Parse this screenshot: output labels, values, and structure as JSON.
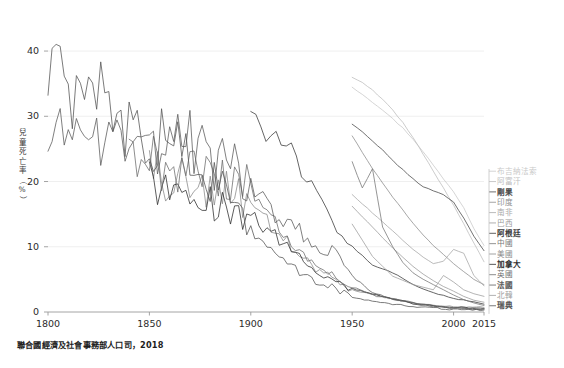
{
  "chart_data": {
    "type": "line",
    "title": "",
    "xlabel": "",
    "ylabel": "兒童死亡率（%）",
    "source_note": "聯合國經濟及社會事務部人口司，2018",
    "xlim": [
      1800,
      2015
    ],
    "ylim": [
      0,
      42
    ],
    "xticks": [
      1800,
      1850,
      1900,
      1950,
      2000,
      2015
    ],
    "yticks": [
      0,
      10,
      20,
      30,
      40
    ],
    "grid": true,
    "legend_position": "right",
    "series": [
      {
        "name": "布吉納法索",
        "color": "#c9c9c9",
        "legend_index": 0,
        "x": [
          1950,
          1955,
          1960,
          1965,
          1970,
          1975,
          1980,
          1985,
          1990,
          1995,
          2000,
          2005,
          2010,
          2015
        ],
        "values": [
          34.5,
          33.4,
          32.2,
          31.0,
          29.6,
          28.2,
          26.5,
          24.6,
          22.5,
          20.4,
          18.4,
          16.0,
          12.8,
          10.2
        ]
      },
      {
        "name": "阿富汗",
        "color": "#bdbdbd",
        "legend_index": 1,
        "x": [
          1950,
          1955,
          1960,
          1965,
          1970,
          1975,
          1980,
          1985,
          1990,
          1995,
          2000,
          2005,
          2010,
          2015
        ],
        "values": [
          36.0,
          35.2,
          34.0,
          32.6,
          31.0,
          29.0,
          26.8,
          24.2,
          21.6,
          19.0,
          16.4,
          13.5,
          10.6,
          7.7
        ]
      },
      {
        "name": "剛果",
        "color": "#4a4a4a",
        "legend_index": 2,
        "x": [
          1950,
          1955,
          1960,
          1965,
          1970,
          1975,
          1980,
          1985,
          1990,
          1995,
          2000,
          2005,
          2010,
          2015
        ],
        "values": [
          28.8,
          27.6,
          26.2,
          24.8,
          23.2,
          21.8,
          20.4,
          19.2,
          18.6,
          18.0,
          16.8,
          14.4,
          11.6,
          9.4
        ]
      },
      {
        "name": "印度",
        "color": "#8e8e8e",
        "legend_index": 3,
        "x": [
          1950,
          1955,
          1960,
          1965,
          1970,
          1975,
          1980,
          1985,
          1990,
          1995,
          2000,
          2005,
          2010,
          2015
        ],
        "values": [
          27.0,
          24.4,
          22.0,
          19.8,
          17.6,
          15.6,
          13.6,
          11.8,
          10.2,
          8.8,
          7.4,
          6.2,
          5.0,
          4.2
        ]
      },
      {
        "name": "南非",
        "color": "#a8a8a8",
        "legend_index": 4,
        "x": [
          1950,
          1955,
          1960,
          1965,
          1970,
          1975,
          1980,
          1985,
          1990,
          1995,
          2000,
          2005,
          2010,
          2015
        ],
        "values": [
          18.0,
          16.6,
          15.2,
          13.8,
          12.4,
          11.0,
          9.6,
          8.4,
          7.4,
          7.8,
          9.6,
          9.0,
          5.6,
          4.0
        ]
      },
      {
        "name": "巴西",
        "color": "#9a9a9a",
        "legend_index": 5,
        "x": [
          1950,
          1955,
          1960,
          1965,
          1970,
          1975,
          1980,
          1985,
          1990,
          1995,
          2000,
          2005,
          2010,
          2015
        ],
        "values": [
          16.2,
          14.6,
          13.0,
          11.4,
          9.8,
          8.4,
          7.0,
          5.8,
          4.8,
          3.9,
          3.2,
          2.4,
          1.8,
          1.5
        ]
      },
      {
        "name": "阿根廷",
        "color": "#3a3a3a",
        "legend_index": 6,
        "x": [
          1900,
          1910,
          1920,
          1930,
          1940,
          1950,
          1960,
          1970,
          1980,
          1990,
          2000,
          2010,
          2015
        ],
        "values": [
          30.0,
          27.0,
          24.5,
          19.0,
          14.0,
          10.0,
          7.2,
          6.0,
          4.2,
          2.9,
          2.1,
          1.5,
          1.2
        ]
      },
      {
        "name": "中國",
        "color": "#787878",
        "legend_index": 7,
        "x": [
          1950,
          1955,
          1960,
          1965,
          1970,
          1975,
          1980,
          1985,
          1990,
          1995,
          2000,
          2005,
          2010,
          2015
        ],
        "values": [
          23.0,
          19.0,
          22.0,
          13.0,
          10.0,
          7.6,
          6.0,
          5.0,
          4.2,
          3.4,
          2.6,
          1.9,
          1.4,
          1.0
        ]
      },
      {
        "name": "美國",
        "color": "#8a8a8a",
        "legend_index": 8,
        "x": [
          1850,
          1870,
          1890,
          1900,
          1910,
          1920,
          1930,
          1940,
          1950,
          1960,
          1970,
          1980,
          1990,
          2000,
          2015
        ],
        "values": [
          22.0,
          19.5,
          18.0,
          16.0,
          13.0,
          10.0,
          7.0,
          5.2,
          3.4,
          2.7,
          2.0,
          1.4,
          1.0,
          0.8,
          0.7
        ]
      },
      {
        "name": "加拿大",
        "color": "#2e2e2e",
        "legend_index": 9,
        "x": [
          1850,
          1870,
          1890,
          1900,
          1910,
          1920,
          1930,
          1940,
          1950,
          1960,
          1970,
          1980,
          1990,
          2000,
          2015
        ],
        "values": [
          20.0,
          18.0,
          16.5,
          15.0,
          12.5,
          9.5,
          7.0,
          5.0,
          3.6,
          2.8,
          2.0,
          1.3,
          0.9,
          0.7,
          0.5
        ]
      },
      {
        "name": "英國",
        "color": "#6e6e6e",
        "legend_index": 10,
        "x": [
          1840,
          1860,
          1880,
          1900,
          1910,
          1920,
          1930,
          1940,
          1950,
          1960,
          1970,
          1980,
          1990,
          2000,
          2015
        ],
        "values": [
          22.5,
          23.0,
          21.0,
          19.0,
          14.5,
          11.0,
          8.0,
          6.0,
          3.8,
          2.6,
          2.0,
          1.4,
          0.9,
          0.7,
          0.5
        ]
      },
      {
        "name": "法國",
        "color": "#5c5c5c",
        "legend_index": 11,
        "x": [
          1800,
          1810,
          1820,
          1830,
          1840,
          1850,
          1860,
          1870,
          1880,
          1890,
          1900,
          1910,
          1920,
          1930,
          1940,
          1950,
          1960,
          1970,
          1980,
          1990,
          2000,
          2015
        ],
        "values": [
          30.0,
          28.0,
          27.5,
          26.0,
          25.5,
          24.0,
          24.5,
          27.0,
          23.0,
          22.5,
          20.0,
          15.0,
          14.0,
          10.0,
          9.5,
          5.5,
          3.0,
          2.0,
          1.3,
          0.9,
          0.6,
          0.45
        ]
      },
      {
        "name": "北韓",
        "color": "#9e9e9e",
        "legend_index": 12,
        "x": [
          1950,
          1960,
          1970,
          1980,
          1990,
          1995,
          2000,
          2005,
          2010,
          2015
        ],
        "values": [
          13.5,
          8.5,
          5.5,
          4.2,
          3.4,
          5.6,
          4.6,
          3.4,
          2.8,
          2.4
        ]
      },
      {
        "name": "瑞典",
        "color": "#555555",
        "legend_index": 13,
        "x": [
          1800,
          1810,
          1820,
          1830,
          1840,
          1850,
          1860,
          1870,
          1880,
          1890,
          1900,
          1910,
          1920,
          1930,
          1940,
          1950,
          1960,
          1970,
          1980,
          1990,
          2000,
          2015
        ],
        "values": [
          38.0,
          32.0,
          36.0,
          30.0,
          28.0,
          26.0,
          27.0,
          22.0,
          20.0,
          18.0,
          13.0,
          9.5,
          7.0,
          5.0,
          3.8,
          2.2,
          1.7,
          1.2,
          0.8,
          0.6,
          0.4,
          0.3
        ]
      }
    ]
  },
  "axes": {
    "yticks": [
      {
        "label": "40",
        "value": 40
      },
      {
        "label": "30",
        "value": 30
      },
      {
        "label": "20",
        "value": 20
      },
      {
        "label": "10",
        "value": 10
      },
      {
        "label": "0",
        "value": 0
      }
    ],
    "xticks": [
      {
        "label": "1800",
        "value": 1800
      },
      {
        "label": "1850",
        "value": 1850
      },
      {
        "label": "1900",
        "value": 1900
      },
      {
        "label": "1950",
        "value": 1950
      },
      {
        "label": "2000",
        "value": 2000
      },
      {
        "label": "2015",
        "value": 2015
      }
    ],
    "ylabel_chars": [
      "兒",
      "童",
      "死",
      "亡",
      "率",
      "（",
      "%",
      "）"
    ]
  },
  "caption": "聯合國經濟及社會事務部人口司，2018"
}
